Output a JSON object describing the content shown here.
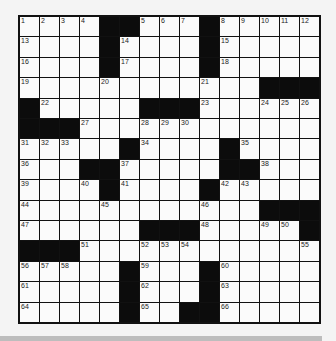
{
  "puzzle": {
    "size": {
      "rows": 15,
      "cols": 15
    },
    "colors": {
      "block": "#0c0c0c",
      "cell": "#fbfbfb",
      "line": "#111111",
      "page": "#f4f4f4",
      "strip": "#bdbdbd"
    },
    "grid": [
      [
        "1",
        "2",
        "3",
        "4",
        "#",
        "#",
        "5",
        "6",
        "7",
        "#",
        "8",
        "9",
        "10",
        "11",
        "12"
      ],
      [
        "13",
        "",
        "",
        "",
        "#",
        "14",
        "",
        "",
        "",
        "#",
        "15",
        "",
        "",
        "",
        ""
      ],
      [
        "16",
        "",
        "",
        "",
        "#",
        "17",
        "",
        "",
        "",
        "#",
        "18",
        "",
        "",
        "",
        ""
      ],
      [
        "19",
        "",
        "",
        "",
        "20",
        "",
        "",
        "",
        "",
        "21",
        "",
        "",
        "#",
        "#",
        "#"
      ],
      [
        "#",
        "22",
        "",
        "",
        "",
        "",
        "#",
        "#",
        "#",
        "23",
        "",
        "",
        "24",
        "25",
        "26"
      ],
      [
        "#",
        "#",
        "#",
        "27",
        "",
        "",
        "28",
        "29",
        "30",
        "",
        "",
        "",
        "",
        "",
        ""
      ],
      [
        "31",
        "32",
        "33",
        "",
        "",
        "#",
        "34",
        "",
        "",
        "",
        "#",
        "35",
        "",
        "",
        ""
      ],
      [
        "36",
        "",
        "",
        "#",
        "#",
        "37",
        "",
        "",
        "",
        "",
        "#",
        "#",
        "38",
        "",
        ""
      ],
      [
        "39",
        "",
        "",
        "40",
        "#",
        "41",
        "",
        "",
        "",
        "#",
        "42",
        "43",
        "",
        "",
        ""
      ],
      [
        "44",
        "",
        "",
        "",
        "45",
        "",
        "",
        "",
        "",
        "46",
        "",
        "",
        "#",
        "#",
        "#"
      ],
      [
        "47",
        "",
        "",
        "",
        "",
        "",
        "#",
        "#",
        "#",
        "48",
        "",
        "",
        "49",
        "50",
        "#"
      ],
      [
        "#",
        "#",
        "#",
        "51",
        "",
        "",
        "52",
        "53",
        "54",
        "",
        "",
        "",
        "",
        "",
        "55"
      ],
      [
        "56",
        "57",
        "58",
        "",
        "",
        "#",
        "59",
        "",
        "",
        "#",
        "60",
        "",
        "",
        "",
        ""
      ],
      [
        "61",
        "",
        "",
        "",
        "",
        "#",
        "62",
        "",
        "",
        "#",
        "63",
        "",
        "",
        "",
        ""
      ],
      [
        "64",
        "",
        "",
        "",
        "",
        "#",
        "65",
        "",
        "#",
        "#",
        "66",
        "",
        "",
        "",
        ""
      ]
    ]
  }
}
